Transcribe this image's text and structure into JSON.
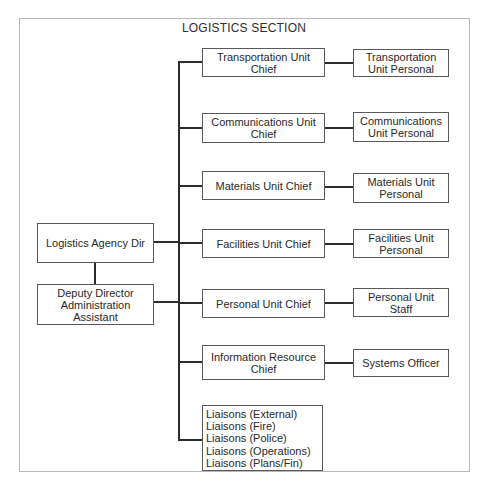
{
  "title": "LOGISTICS SECTION",
  "director": {
    "label": "Logistics Agency Dir"
  },
  "deputy": {
    "line1": "Deputy Director",
    "line2": "Administration",
    "line3": "Assistant"
  },
  "units": [
    {
      "chief": [
        "Transportation Unit",
        "Chief"
      ],
      "staff": [
        "Transportation",
        "Unit Personal"
      ]
    },
    {
      "chief": [
        "Communications Unit",
        "Chief"
      ],
      "staff": [
        "Communications",
        "Unit Personal"
      ]
    },
    {
      "chief": [
        "Materials Unit Chief"
      ],
      "staff": [
        "Materials Unit",
        "Personal"
      ]
    },
    {
      "chief": [
        "Facilities Unit Chief"
      ],
      "staff": [
        "Facilities Unit",
        "Personal"
      ]
    },
    {
      "chief": [
        "Personal Unit Chief"
      ],
      "staff": [
        "Personal Unit",
        "Staff"
      ]
    },
    {
      "chief": [
        "Information Resource",
        "Chief"
      ],
      "staff": [
        "Systems Officer"
      ]
    }
  ],
  "liaisons": [
    "Liaisons (External)",
    "Liaisons (Fire)",
    "Liaisons (Police)",
    "Liaisons (Operations)",
    "Liaisons (Plans/Fin)"
  ],
  "colors": {
    "line": "#2c2c2c",
    "box_border": "#5a5a5a",
    "frame_border": "#b8b8b8",
    "text": "#2a2a2a"
  }
}
